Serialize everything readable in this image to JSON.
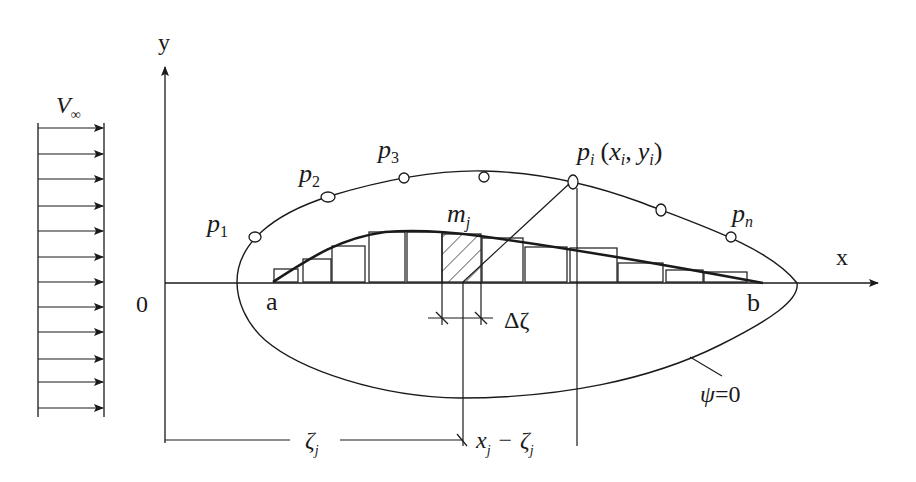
{
  "diagram": {
    "type": "potential-flow source-distribution over airfoil-like body",
    "colors": {
      "ink": "#1a1a1a",
      "background": "#ffffff"
    },
    "axes": {
      "x_label": "x",
      "y_label": "y",
      "origin_label": "0"
    },
    "freestream": {
      "label_main": "V",
      "label_sub": "∞",
      "arrow_count": 12
    },
    "body": {
      "contour_label_psi": "ψ",
      "contour_label_eq": "=0",
      "leading_point": "a",
      "trailing_point": "b"
    },
    "surface_points": [
      {
        "label": "p",
        "sub": "1"
      },
      {
        "label": "p",
        "sub": "2"
      },
      {
        "label": "p",
        "sub": "3"
      },
      {
        "label": "p",
        "sub": "i",
        "coords_open": "(",
        "x": "x",
        "x_sub": "i",
        "comma": ",",
        "y": "y",
        "y_sub": "i",
        "coords_close": ")"
      },
      {
        "label": "p",
        "sub": "n"
      }
    ],
    "source_element": {
      "label": "m",
      "sub": "j"
    },
    "dimensions": {
      "delta": "Δζ",
      "zeta": "ζ",
      "zeta_sub": "j",
      "diff_x": "x",
      "diff_x_sub": "j",
      "diff_minus": "−",
      "diff_zeta": "ζ",
      "diff_zeta_sub": "j"
    }
  }
}
